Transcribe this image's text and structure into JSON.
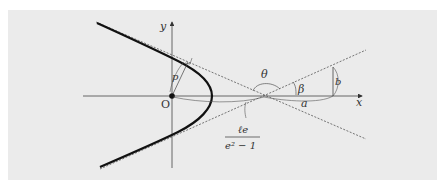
{
  "figure": {
    "type": "hyperbola-polar-diagram",
    "background_color": "#ebebeb",
    "line_color": "#333333",
    "labels": {
      "y_axis": "y",
      "x_axis": "x",
      "origin": "O",
      "p": "p",
      "theta": "θ",
      "beta": "β",
      "a": "a",
      "b": "b",
      "center_distance_numerator": "ℓe",
      "center_distance_denominator": "e² − 1"
    },
    "elements": [
      {
        "name": "hyperbola-branch",
        "style": "thick solid"
      },
      {
        "name": "asymptote-upper",
        "style": "dotted"
      },
      {
        "name": "asymptote-lower",
        "style": "dotted"
      },
      {
        "name": "x-axis",
        "style": "solid arrow"
      },
      {
        "name": "y-axis",
        "style": "solid arrow"
      },
      {
        "name": "focal-radius-p",
        "style": "thin solid"
      },
      {
        "name": "semi-minor-axis-b",
        "style": "thin solid"
      }
    ]
  }
}
